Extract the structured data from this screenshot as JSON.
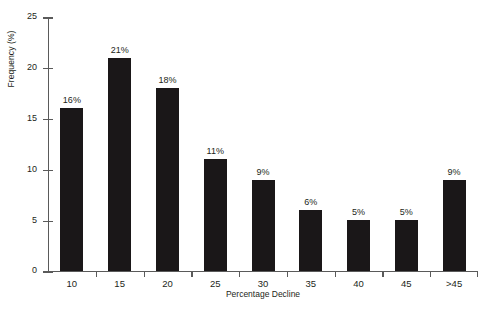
{
  "chart_data": {
    "type": "bar",
    "title": "",
    "subtitle": "",
    "xlabel": "Percentage Decline",
    "ylabel": "Frequency (%)",
    "categories": [
      "10",
      "15",
      "20",
      "25",
      "30",
      "35",
      "40",
      "45",
      ">45"
    ],
    "values": [
      16,
      21,
      18,
      11,
      9,
      6,
      5,
      5,
      9
    ],
    "data_labels": [
      "16%",
      "21%",
      "18%",
      "11%",
      "9%",
      "6%",
      "5%",
      "5%",
      "9%"
    ],
    "ylim": [
      0,
      25
    ],
    "yticks": [
      0,
      5,
      10,
      15,
      20,
      25
    ],
    "ytick_labels": [
      "0",
      "5",
      "10",
      "15",
      "20",
      "25"
    ],
    "grid": false,
    "legend": null,
    "legend_position": "none",
    "bar_color": "#1a1718",
    "axis_color": "#5a5a5a",
    "background_color": "#ffffff",
    "text_color": "#231f20"
  }
}
